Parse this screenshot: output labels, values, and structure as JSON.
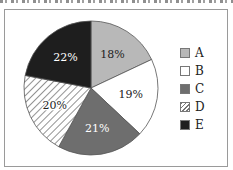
{
  "chart_data": {
    "type": "pie",
    "title": "",
    "start": "top",
    "direction": "clockwise",
    "slices": [
      {
        "label": "A",
        "value": 18,
        "display": "18%",
        "fill": "#b8b8b8",
        "pattern": "solid",
        "text_color": "#222222"
      },
      {
        "label": "B",
        "value": 19,
        "display": "19%",
        "fill": "#ffffff",
        "pattern": "solid",
        "text_color": "#222222"
      },
      {
        "label": "C",
        "value": 21,
        "display": "21%",
        "fill": "#6e6e6e",
        "pattern": "solid",
        "text_color": "#ffffff"
      },
      {
        "label": "D",
        "value": 20,
        "display": "20%",
        "fill": "#ffffff",
        "pattern": "hatch",
        "text_color": "#222222"
      },
      {
        "label": "E",
        "value": 22,
        "display": "22%",
        "fill": "#1e1e1e",
        "pattern": "solid",
        "text_color": "#ffffff"
      }
    ],
    "legend": {
      "placement": "right",
      "entries": [
        "A",
        "B",
        "C",
        "D",
        "E"
      ]
    }
  }
}
